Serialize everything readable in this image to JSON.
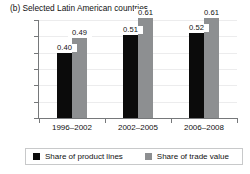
{
  "chart_data": {
    "type": "bar",
    "title": "(b) Selected Latin American countries",
    "xlabel": "",
    "ylabel": "",
    "ylim": [
      0,
      0.6
    ],
    "yticks": [
      "0",
      "0.1",
      "0.2",
      "0.3",
      "0.4",
      "0.5",
      "0.6"
    ],
    "ytick_values": [
      0,
      0.1,
      0.2,
      0.3,
      0.4,
      0.5,
      0.6
    ],
    "grid": true,
    "legend_position": "bottom",
    "categories": [
      "1996–2002",
      "2002–2005",
      "2006–2008"
    ],
    "series": [
      {
        "name": "Share of product lines",
        "color": "#0b0b0b",
        "values": [
          0.4,
          0.51,
          0.52
        ],
        "labels": [
          "0.40",
          "0.51",
          "0.52"
        ]
      },
      {
        "name": "Share of trade value",
        "color": "#8d8f91",
        "values": [
          0.49,
          0.61,
          0.61
        ],
        "labels": [
          "0.49",
          "0.61",
          "0.61"
        ]
      }
    ]
  },
  "axis": {
    "tick_color": "#76787a",
    "grid_color": "#ececed"
  }
}
